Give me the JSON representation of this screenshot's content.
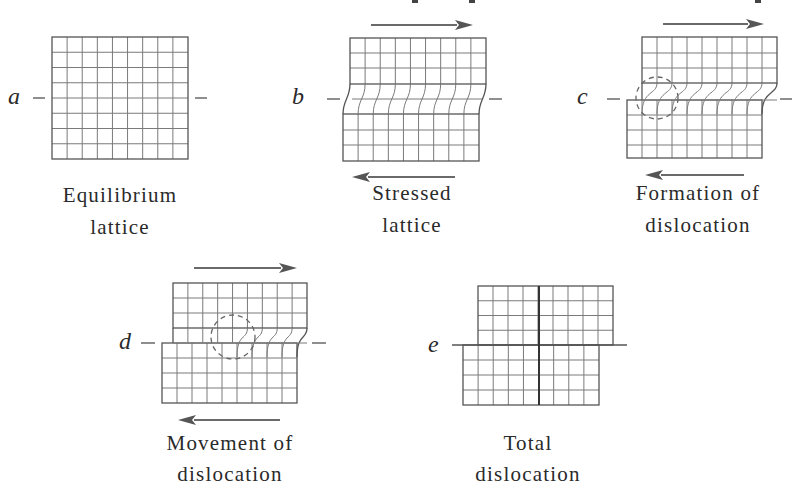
{
  "figure": {
    "colors": {
      "grid": "#7a7a7a",
      "edge": "#555555",
      "arrow": "#555555",
      "text": "#2a2a2a",
      "background": "#ffffff"
    },
    "top_cropped_text_marks": [
      [
        415,
        0
      ],
      [
        472,
        0
      ],
      [
        758,
        0
      ]
    ],
    "panels": [
      {
        "id": "a",
        "label": "a",
        "label_pos": [
          8,
          104
        ],
        "dashes": [
          [
            33,
            98,
            45
          ],
          [
            195,
            98,
            207
          ]
        ],
        "caption": [
          "Equilibrium",
          "lattice"
        ],
        "caption_center": 120,
        "caption_y": [
          202,
          234
        ],
        "type": "equilibrium",
        "box": {
          "x": 52,
          "y": 37,
          "w": 136,
          "h": 122,
          "cols": 9,
          "rows": 8
        }
      },
      {
        "id": "b",
        "label": "b",
        "label_pos": [
          292,
          104
        ],
        "dashes": [
          [
            327,
            99,
            340
          ],
          [
            489,
            99,
            502
          ]
        ],
        "caption": [
          "Stressed",
          "lattice"
        ],
        "caption_center": 412,
        "caption_y": [
          200,
          232
        ],
        "type": "stressed",
        "top": {
          "x": 350,
          "y": 38,
          "w": 136,
          "rows_y": [
            38,
            53,
            68,
            84
          ]
        },
        "bottom": {
          "x": 343,
          "y": 114,
          "w": 136,
          "rows_y": [
            114,
            130,
            145,
            161
          ]
        },
        "cols": 9,
        "mid_y": 99,
        "arrows": [
          {
            "dir": "right",
            "x1": 371,
            "x2": 473,
            "y": 25
          },
          {
            "dir": "left",
            "x1": 352,
            "x2": 455,
            "y": 177
          }
        ]
      },
      {
        "id": "c",
        "label": "c",
        "label_pos": [
          577,
          104
        ],
        "dashes": [
          [
            607,
            99,
            620
          ],
          [
            780,
            99,
            792
          ]
        ],
        "caption": [
          "Formation of",
          "dislocation"
        ],
        "caption_center": 698,
        "caption_y": [
          200,
          232
        ],
        "type": "dislocation",
        "top": {
          "x": 642,
          "w": 135,
          "rows_y": [
            37,
            53,
            68,
            83
          ]
        },
        "bottom": {
          "x": 627,
          "w": 135,
          "rows_y": [
            100,
            115,
            130,
            145,
            158
          ]
        },
        "cols": 9,
        "interface_y": 100,
        "defect_col": 0,
        "circle": {
          "cx": 657,
          "cy": 98,
          "r": 21
        },
        "arrows": [
          {
            "dir": "right",
            "x1": 663,
            "x2": 764,
            "y": 24
          },
          {
            "dir": "left",
            "x1": 645,
            "x2": 744,
            "y": 175
          }
        ]
      },
      {
        "id": "d",
        "label": "d",
        "label_pos": [
          119,
          349
        ],
        "dashes": [
          [
            141,
            343,
            155
          ],
          [
            312,
            343,
            326
          ]
        ],
        "caption": [
          "Movement of",
          "dislocation"
        ],
        "caption_center": 230,
        "caption_y": [
          450,
          481
        ],
        "type": "dislocation",
        "top": {
          "x": 173,
          "w": 134,
          "rows_y": [
            283,
            298,
            313,
            328
          ]
        },
        "bottom": {
          "x": 162,
          "w": 135,
          "rows_y": [
            343,
            358,
            373,
            388,
            403
          ]
        },
        "cols": 9,
        "interface_y": 343,
        "defect_col": 4,
        "circle": {
          "cx": 233,
          "cy": 337,
          "r": 22
        },
        "arrows": [
          {
            "dir": "right",
            "x1": 194,
            "x2": 297,
            "y": 268
          },
          {
            "dir": "left",
            "x1": 178,
            "x2": 280,
            "y": 420
          }
        ]
      },
      {
        "id": "e",
        "label": "e",
        "label_pos": [
          428,
          352
        ],
        "caption": [
          "Total",
          "dislocation"
        ],
        "caption_center": 528,
        "caption_y": [
          450,
          481
        ],
        "type": "total",
        "slip_line": {
          "x1": 452,
          "x2": 627,
          "y": 345
        },
        "top": {
          "x": 478,
          "y": 286,
          "w": 135,
          "h": 59,
          "cols": 9,
          "rows": 4
        },
        "bottom": {
          "x": 463,
          "y": 345,
          "w": 136,
          "h": 60,
          "cols": 9,
          "rows": 4
        },
        "bold_x": 539
      }
    ]
  }
}
